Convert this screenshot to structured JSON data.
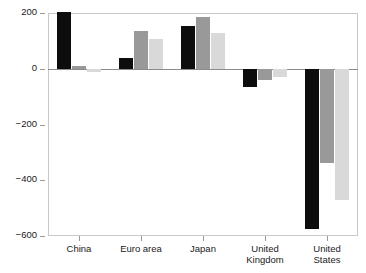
{
  "title_sliver": "",
  "chart_data": {
    "type": "bar",
    "title": "",
    "subtitle": "",
    "xlabel": "",
    "ylabel": "",
    "ylim": [
      -600,
      200
    ],
    "yticks": [
      200,
      0,
      -200,
      -400,
      -600
    ],
    "ytick_labels": [
      "200",
      "0",
      "−200",
      "−400",
      "−600"
    ],
    "grid": false,
    "legend": "none",
    "zero_line": true,
    "categories": [
      "China",
      "Euro area",
      "Japan",
      "United\nKingdom",
      "United\nStates"
    ],
    "series": [
      {
        "name": "series-1",
        "color": "#0d0d0d",
        "values": [
          205,
          40,
          152,
          -65,
          -575
        ]
      },
      {
        "name": "series-2",
        "color": "#999999",
        "values": [
          10,
          135,
          185,
          -40,
          -338
        ]
      },
      {
        "name": "series-3",
        "color": "#d9d9d9",
        "values": [
          -12,
          105,
          130,
          -28,
          -470
        ]
      }
    ]
  },
  "colors": {
    "series_1": "#0d0d0d",
    "series_2": "#999999",
    "series_3": "#d9d9d9",
    "axis": "#9a9a9a",
    "frame": "#c8c8c8",
    "zero_line": "#8c8c8c",
    "text": "#1a1a1a",
    "background": "#ffffff"
  }
}
